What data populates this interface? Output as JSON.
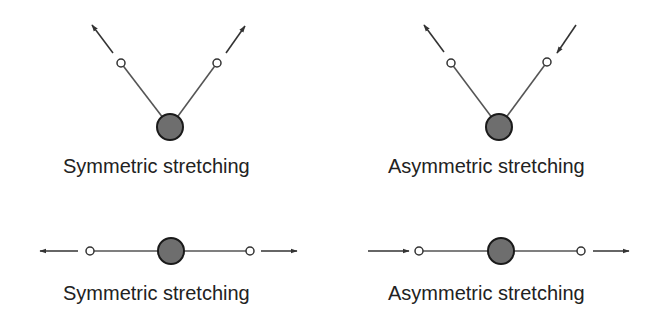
{
  "figure": {
    "colors": {
      "bond": "#555555",
      "arrow": "#333333",
      "central_atom_fill": "#6e6e6e",
      "central_atom_stroke": "#1a1a1a",
      "outer_atom_fill": "#ffffff",
      "outer_atom_stroke": "#333333",
      "text": "#222222"
    },
    "panels": [
      {
        "id": "bent-symmetric",
        "geometry": "bent",
        "label": "Symmetric stretching",
        "central_atom": {
          "x": 170,
          "y": 127,
          "r": 13
        },
        "outer_atoms": [
          {
            "x": 121,
            "y": 63,
            "r": 4
          },
          {
            "x": 217,
            "y": 63,
            "r": 4
          }
        ],
        "arrows": [
          {
            "from": [
              113,
              53
            ],
            "to": [
              92,
              25
            ],
            "direction": "outward"
          },
          {
            "from": [
              226,
              53
            ],
            "to": [
              245,
              26
            ],
            "direction": "outward"
          }
        ]
      },
      {
        "id": "bent-asymmetric",
        "geometry": "bent",
        "label": "Asymmetric stretching",
        "central_atom": {
          "x": 499,
          "y": 127,
          "r": 13
        },
        "outer_atoms": [
          {
            "x": 451,
            "y": 63,
            "r": 4
          },
          {
            "x": 547,
            "y": 62,
            "r": 4
          }
        ],
        "arrows": [
          {
            "from": [
              444,
              52
            ],
            "to": [
              424,
              25
            ],
            "direction": "outward"
          },
          {
            "from": [
              576,
              25
            ],
            "to": [
              557,
              53
            ],
            "direction": "inward"
          }
        ]
      },
      {
        "id": "linear-symmetric",
        "geometry": "linear",
        "label": "Symmetric stretching",
        "central_atom": {
          "x": 171,
          "y": 251,
          "r": 13
        },
        "outer_atoms": [
          {
            "x": 90,
            "y": 251,
            "r": 4
          },
          {
            "x": 250,
            "y": 251,
            "r": 4
          }
        ],
        "arrows": [
          {
            "from": [
              78,
              251
            ],
            "to": [
              40,
              251
            ],
            "direction": "outward"
          },
          {
            "from": [
              261,
              251
            ],
            "to": [
              297,
              251
            ],
            "direction": "outward"
          }
        ]
      },
      {
        "id": "linear-asymmetric",
        "geometry": "linear",
        "label": "Asymmetric stretching",
        "central_atom": {
          "x": 501,
          "y": 251,
          "r": 13
        },
        "outer_atoms": [
          {
            "x": 419,
            "y": 251,
            "r": 4
          },
          {
            "x": 581,
            "y": 251,
            "r": 4
          }
        ],
        "arrows": [
          {
            "from": [
              368,
              251
            ],
            "to": [
              409,
              251
            ],
            "direction": "inward"
          },
          {
            "from": [
              593,
              251
            ],
            "to": [
              629,
              251
            ],
            "direction": "outward"
          }
        ]
      }
    ],
    "labels": {
      "top_left": "Symmetric stretching",
      "top_right": "Asymmetric stretching",
      "bottom_left": "Symmetric stretching",
      "bottom_right": "Asymmetric stretching"
    }
  }
}
